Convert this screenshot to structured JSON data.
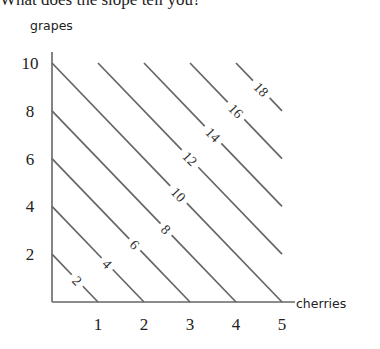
{
  "question_text": "What does the slope tell you?",
  "chart_data": {
    "type": "line",
    "title": "",
    "xlabel": "cherries",
    "ylabel": "grapes",
    "xlim": [
      0,
      5
    ],
    "ylim": [
      0,
      10
    ],
    "x_ticks": [
      1,
      2,
      3,
      4,
      5
    ],
    "y_ticks": [
      2,
      4,
      6,
      8,
      10
    ],
    "grid": false,
    "legend": "none",
    "series": [
      {
        "name": "2",
        "label": "2",
        "points": [
          [
            0,
            2
          ],
          [
            1,
            0
          ]
        ]
      },
      {
        "name": "4",
        "label": "4",
        "points": [
          [
            0,
            4
          ],
          [
            2,
            0
          ]
        ]
      },
      {
        "name": "6",
        "label": "6",
        "points": [
          [
            0,
            6
          ],
          [
            3,
            0
          ]
        ]
      },
      {
        "name": "8",
        "label": "8",
        "points": [
          [
            0,
            8
          ],
          [
            4,
            0
          ]
        ]
      },
      {
        "name": "10",
        "label": "10",
        "points": [
          [
            0,
            10
          ],
          [
            5,
            0
          ]
        ]
      },
      {
        "name": "12",
        "label": "12",
        "points": [
          [
            1,
            10
          ],
          [
            5,
            2
          ]
        ]
      },
      {
        "name": "14",
        "label": "14",
        "points": [
          [
            2,
            10
          ],
          [
            5,
            4
          ]
        ]
      },
      {
        "name": "16",
        "label": "16",
        "points": [
          [
            3,
            10
          ],
          [
            5,
            6
          ]
        ]
      },
      {
        "name": "18",
        "label": "18",
        "points": [
          [
            4,
            10
          ],
          [
            5,
            8
          ]
        ]
      }
    ],
    "line_color": "#666666"
  }
}
